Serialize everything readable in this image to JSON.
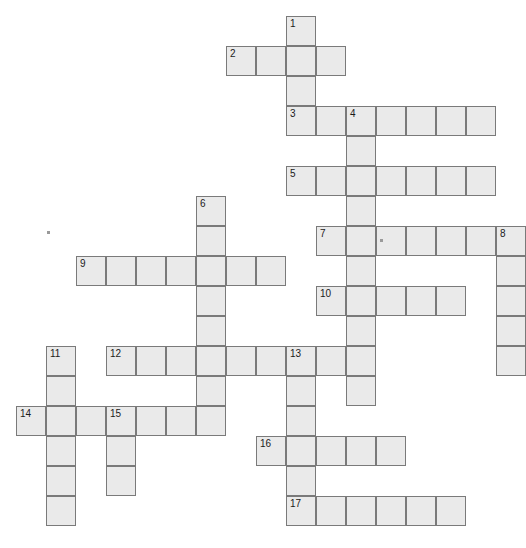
{
  "puzzle": {
    "title": "Crossword puzzle grid",
    "cell_size": 30,
    "origin_x": 16,
    "origin_y": 16,
    "columns": 17,
    "rows": 18,
    "cell_fill": "#eaeaea",
    "cell_border": "#7a7a7a",
    "number_color": "#1b1b1b",
    "page_background": "#ffffff",
    "entries": [
      {
        "number": "1",
        "direction": "down",
        "col": 9,
        "row": 0,
        "length": 4
      },
      {
        "number": "2",
        "direction": "across",
        "col": 7,
        "row": 1,
        "length": 4
      },
      {
        "number": "3",
        "direction": "across",
        "col": 9,
        "row": 3,
        "length": 7
      },
      {
        "number": "4",
        "direction": "down",
        "col": 11,
        "row": 3,
        "length": 10
      },
      {
        "number": "5",
        "direction": "across",
        "col": 9,
        "row": 5,
        "length": 7
      },
      {
        "number": "6",
        "direction": "down",
        "col": 6,
        "row": 6,
        "length": 6
      },
      {
        "number": "7",
        "direction": "across",
        "col": 10,
        "row": 7,
        "length": 7
      },
      {
        "number": "8",
        "direction": "down",
        "col": 16,
        "row": 7,
        "length": 5
      },
      {
        "number": "9",
        "direction": "across",
        "col": 2,
        "row": 8,
        "length": 7
      },
      {
        "number": "10",
        "direction": "across",
        "col": 10,
        "row": 9,
        "length": 5
      },
      {
        "number": "11",
        "direction": "down",
        "col": 1,
        "row": 11,
        "length": 6
      },
      {
        "number": "12",
        "direction": "across",
        "col": 3,
        "row": 11,
        "length": 9
      },
      {
        "number": "13",
        "direction": "down",
        "col": 9,
        "row": 11,
        "length": 6
      },
      {
        "number": "14",
        "direction": "across",
        "col": 0,
        "row": 13,
        "length": 7
      },
      {
        "number": "15",
        "direction": "down",
        "col": 3,
        "row": 13,
        "length": 3
      },
      {
        "number": "16",
        "direction": "across",
        "col": 8,
        "row": 14,
        "length": 5
      },
      {
        "number": "17",
        "direction": "across",
        "col": 9,
        "row": 16,
        "length": 6
      }
    ],
    "cells": [
      {
        "col": 9,
        "row": 0,
        "number": "1",
        "letter": ""
      },
      {
        "col": 7,
        "row": 1,
        "number": "2",
        "letter": ""
      },
      {
        "col": 8,
        "row": 1,
        "number": "",
        "letter": ""
      },
      {
        "col": 9,
        "row": 1,
        "number": "",
        "letter": ""
      },
      {
        "col": 10,
        "row": 1,
        "number": "",
        "letter": ""
      },
      {
        "col": 9,
        "row": 2,
        "number": "",
        "letter": ""
      },
      {
        "col": 9,
        "row": 3,
        "number": "3",
        "letter": ""
      },
      {
        "col": 10,
        "row": 3,
        "number": "",
        "letter": ""
      },
      {
        "col": 11,
        "row": 3,
        "number": "4",
        "letter": ""
      },
      {
        "col": 12,
        "row": 3,
        "number": "",
        "letter": ""
      },
      {
        "col": 13,
        "row": 3,
        "number": "",
        "letter": ""
      },
      {
        "col": 14,
        "row": 3,
        "number": "",
        "letter": ""
      },
      {
        "col": 15,
        "row": 3,
        "number": "",
        "letter": ""
      },
      {
        "col": 11,
        "row": 4,
        "number": "",
        "letter": ""
      },
      {
        "col": 9,
        "row": 5,
        "number": "5",
        "letter": ""
      },
      {
        "col": 10,
        "row": 5,
        "number": "",
        "letter": ""
      },
      {
        "col": 11,
        "row": 5,
        "number": "",
        "letter": ""
      },
      {
        "col": 12,
        "row": 5,
        "number": "",
        "letter": ""
      },
      {
        "col": 13,
        "row": 5,
        "number": "",
        "letter": ""
      },
      {
        "col": 14,
        "row": 5,
        "number": "",
        "letter": ""
      },
      {
        "col": 15,
        "row": 5,
        "number": "",
        "letter": ""
      },
      {
        "col": 11,
        "row": 6,
        "number": "",
        "letter": ""
      },
      {
        "col": 6,
        "row": 6,
        "number": "6",
        "letter": ""
      },
      {
        "col": 6,
        "row": 7,
        "number": "",
        "letter": ""
      },
      {
        "col": 10,
        "row": 7,
        "number": "7",
        "letter": ""
      },
      {
        "col": 11,
        "row": 7,
        "number": "",
        "letter": ""
      },
      {
        "col": 12,
        "row": 7,
        "number": "",
        "letter": ""
      },
      {
        "col": 13,
        "row": 7,
        "number": "",
        "letter": ""
      },
      {
        "col": 14,
        "row": 7,
        "number": "",
        "letter": ""
      },
      {
        "col": 15,
        "row": 7,
        "number": "",
        "letter": ""
      },
      {
        "col": 16,
        "row": 7,
        "number": "8",
        "letter": ""
      },
      {
        "col": 2,
        "row": 8,
        "number": "9",
        "letter": ""
      },
      {
        "col": 3,
        "row": 8,
        "number": "",
        "letter": ""
      },
      {
        "col": 4,
        "row": 8,
        "number": "",
        "letter": ""
      },
      {
        "col": 5,
        "row": 8,
        "number": "",
        "letter": ""
      },
      {
        "col": 6,
        "row": 8,
        "number": "",
        "letter": ""
      },
      {
        "col": 7,
        "row": 8,
        "number": "",
        "letter": ""
      },
      {
        "col": 8,
        "row": 8,
        "number": "",
        "letter": ""
      },
      {
        "col": 11,
        "row": 8,
        "number": "",
        "letter": ""
      },
      {
        "col": 16,
        "row": 8,
        "number": "",
        "letter": ""
      },
      {
        "col": 6,
        "row": 9,
        "number": "",
        "letter": ""
      },
      {
        "col": 10,
        "row": 9,
        "number": "10",
        "letter": ""
      },
      {
        "col": 11,
        "row": 9,
        "number": "",
        "letter": ""
      },
      {
        "col": 12,
        "row": 9,
        "number": "",
        "letter": ""
      },
      {
        "col": 13,
        "row": 9,
        "number": "",
        "letter": ""
      },
      {
        "col": 14,
        "row": 9,
        "number": "",
        "letter": ""
      },
      {
        "col": 16,
        "row": 9,
        "number": "",
        "letter": ""
      },
      {
        "col": 6,
        "row": 10,
        "number": "",
        "letter": ""
      },
      {
        "col": 11,
        "row": 10,
        "number": "",
        "letter": ""
      },
      {
        "col": 16,
        "row": 10,
        "number": "",
        "letter": ""
      },
      {
        "col": 1,
        "row": 11,
        "number": "11",
        "letter": ""
      },
      {
        "col": 3,
        "row": 11,
        "number": "12",
        "letter": ""
      },
      {
        "col": 4,
        "row": 11,
        "number": "",
        "letter": ""
      },
      {
        "col": 5,
        "row": 11,
        "number": "",
        "letter": ""
      },
      {
        "col": 6,
        "row": 11,
        "number": "",
        "letter": ""
      },
      {
        "col": 7,
        "row": 11,
        "number": "",
        "letter": ""
      },
      {
        "col": 8,
        "row": 11,
        "number": "",
        "letter": ""
      },
      {
        "col": 9,
        "row": 11,
        "number": "13",
        "letter": ""
      },
      {
        "col": 10,
        "row": 11,
        "number": "",
        "letter": ""
      },
      {
        "col": 11,
        "row": 11,
        "number": "",
        "letter": ""
      },
      {
        "col": 16,
        "row": 11,
        "number": "",
        "letter": ""
      },
      {
        "col": 1,
        "row": 12,
        "number": "",
        "letter": ""
      },
      {
        "col": 6,
        "row": 12,
        "number": "",
        "letter": ""
      },
      {
        "col": 9,
        "row": 12,
        "number": "",
        "letter": ""
      },
      {
        "col": 11,
        "row": 12,
        "number": "",
        "letter": ""
      },
      {
        "col": 0,
        "row": 13,
        "number": "14",
        "letter": ""
      },
      {
        "col": 1,
        "row": 13,
        "number": "",
        "letter": ""
      },
      {
        "col": 2,
        "row": 13,
        "number": "",
        "letter": ""
      },
      {
        "col": 3,
        "row": 13,
        "number": "15",
        "letter": ""
      },
      {
        "col": 4,
        "row": 13,
        "number": "",
        "letter": ""
      },
      {
        "col": 5,
        "row": 13,
        "number": "",
        "letter": ""
      },
      {
        "col": 6,
        "row": 13,
        "number": "",
        "letter": ""
      },
      {
        "col": 9,
        "row": 13,
        "number": "",
        "letter": ""
      },
      {
        "col": 1,
        "row": 14,
        "number": "",
        "letter": ""
      },
      {
        "col": 3,
        "row": 14,
        "number": "",
        "letter": ""
      },
      {
        "col": 8,
        "row": 14,
        "number": "16",
        "letter": ""
      },
      {
        "col": 9,
        "row": 14,
        "number": "",
        "letter": ""
      },
      {
        "col": 10,
        "row": 14,
        "number": "",
        "letter": ""
      },
      {
        "col": 11,
        "row": 14,
        "number": "",
        "letter": ""
      },
      {
        "col": 12,
        "row": 14,
        "number": "",
        "letter": ""
      },
      {
        "col": 1,
        "row": 15,
        "number": "",
        "letter": ""
      },
      {
        "col": 3,
        "row": 15,
        "number": "",
        "letter": ""
      },
      {
        "col": 9,
        "row": 15,
        "number": "",
        "letter": ""
      },
      {
        "col": 1,
        "row": 16,
        "number": "",
        "letter": ""
      },
      {
        "col": 9,
        "row": 16,
        "number": "17",
        "letter": ""
      },
      {
        "col": 10,
        "row": 16,
        "number": "",
        "letter": ""
      },
      {
        "col": 11,
        "row": 16,
        "number": "",
        "letter": ""
      },
      {
        "col": 12,
        "row": 16,
        "number": "",
        "letter": ""
      },
      {
        "col": 13,
        "row": 16,
        "number": "",
        "letter": ""
      },
      {
        "col": 14,
        "row": 16,
        "number": "",
        "letter": ""
      }
    ],
    "artifacts": [
      {
        "name": "speck-left",
        "x": 47,
        "y": 231
      },
      {
        "name": "speck-grid",
        "x": 380,
        "y": 239
      }
    ]
  }
}
